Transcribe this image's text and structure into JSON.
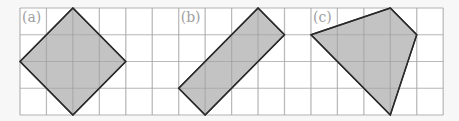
{
  "figure": {
    "grid": {
      "origin_x": 20,
      "origin_y": 8,
      "cols": 16,
      "rows": 4,
      "cell_w": 26.45,
      "cell_h": 26.75,
      "line_color": "#d4d4d4",
      "background": "#ffffff"
    },
    "shape_fill": "#b9b9b9",
    "shape_stroke": "#2a2a2a",
    "shapes": [
      {
        "label": "(a)",
        "label_col": 0,
        "vertices": [
          [
            2,
            0
          ],
          [
            4,
            2
          ],
          [
            2,
            4
          ],
          [
            0,
            2
          ]
        ]
      },
      {
        "label": "(b)",
        "label_col": 6,
        "vertices": [
          [
            9,
            0
          ],
          [
            10,
            1
          ],
          [
            7,
            4
          ],
          [
            6,
            3
          ]
        ]
      },
      {
        "label": "(c)",
        "label_col": 11,
        "vertices": [
          [
            14,
            0
          ],
          [
            15,
            1
          ],
          [
            14,
            4
          ],
          [
            11,
            1
          ]
        ]
      }
    ]
  }
}
